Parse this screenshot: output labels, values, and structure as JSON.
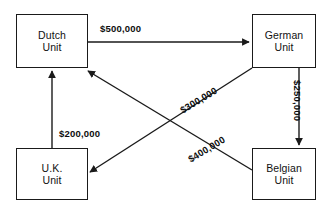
{
  "diagram": {
    "type": "flow-network",
    "background_color": "#ffffff",
    "line_color": "#1a1a1a",
    "text_color": "#111111",
    "nodes": [
      {
        "id": "dutch",
        "label_line1": "Dutch",
        "label_line2": "Unit"
      },
      {
        "id": "german",
        "label_line1": "German",
        "label_line2": "Unit"
      },
      {
        "id": "uk",
        "label_line1": "U.K.",
        "label_line2": "Unit"
      },
      {
        "id": "belgian",
        "label_line1": "Belgian",
        "label_line2": "Unit"
      }
    ],
    "edges": [
      {
        "id": "dutch-german",
        "from": "Dutch Unit",
        "to": "German Unit",
        "amount": "$500,000"
      },
      {
        "id": "german-belgian",
        "from": "German Unit",
        "to": "Belgian Unit",
        "amount": "$250,000"
      },
      {
        "id": "uk-dutch",
        "from": "U.K. Unit",
        "to": "Dutch Unit",
        "amount": "$200,000"
      },
      {
        "id": "belgian-dutch",
        "from": "Belgian Unit",
        "to": "Dutch Unit",
        "amount": "$300,000"
      },
      {
        "id": "german-uk",
        "from": "German Unit",
        "to": "U.K. Unit",
        "amount": "$400,000"
      }
    ]
  }
}
